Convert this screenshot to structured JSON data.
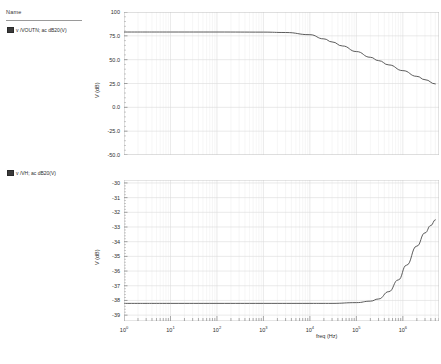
{
  "legend": {
    "header": "Name",
    "entries": [
      {
        "label": "v /VOUTN; ac dB20(V)",
        "swatch_color": "#3a3a3a",
        "icon": "color-swatch-icon"
      },
      {
        "label": "v /VH; ac dB20(V)",
        "swatch_color": "#3a3a3a",
        "icon": "color-swatch-icon"
      }
    ]
  },
  "chart_data": [
    {
      "type": "line",
      "title": "",
      "xlabel": "",
      "ylabel": "V (dB)",
      "xscale": "log",
      "xlim": [
        1,
        6000000
      ],
      "ylim": [
        -50,
        100
      ],
      "grid": true,
      "legend_position": "left-panel",
      "xticks": [
        "10^0",
        "10^1",
        "10^2",
        "10^3",
        "10^4",
        "10^5",
        "10^6"
      ],
      "yticks": [
        "100",
        "75.0",
        "50.0",
        "25.0",
        "0.0",
        "-25.0",
        "-50.0"
      ],
      "ytick_values": [
        100,
        75,
        50,
        25,
        0,
        -25,
        -50
      ],
      "series": [
        {
          "name": "v /VOUTN; ac dB20(V)",
          "color": "#4a4a4a",
          "x": [
            1,
            10,
            100,
            1000,
            3000,
            10000,
            20000,
            30000,
            50000,
            100000,
            200000,
            300000,
            500000,
            1000000,
            2000000,
            3000000,
            5000000
          ],
          "values": [
            79,
            79,
            79,
            78.9,
            78.5,
            76.2,
            71.8,
            68.6,
            64.4,
            58.5,
            52.5,
            49.0,
            44.5,
            38.5,
            32.5,
            29.0,
            24.5
          ]
        }
      ]
    },
    {
      "type": "line",
      "title": "",
      "xlabel": "freq (Hz)",
      "ylabel": "V (dB)",
      "xscale": "log",
      "xlim": [
        1,
        6000000
      ],
      "ylim": [
        -39.4,
        -29.8
      ],
      "grid": true,
      "legend_position": "left-panel",
      "xticks": [
        "10^0",
        "10^1",
        "10^2",
        "10^3",
        "10^4",
        "10^5",
        "10^6"
      ],
      "yticks": [
        "-30",
        "-31",
        "-32",
        "-33",
        "-34",
        "-35",
        "-36",
        "-37",
        "-38",
        "-39"
      ],
      "ytick_values": [
        -30,
        -31,
        -32,
        -33,
        -34,
        -35,
        -36,
        -37,
        -38,
        -39
      ],
      "series": [
        {
          "name": "v /VH; ac dB20(V)",
          "color": "#4a4a4a",
          "x": [
            1,
            10,
            100,
            1000,
            10000,
            30000,
            100000,
            200000,
            300000,
            500000,
            800000,
            1200000,
            2000000,
            3000000,
            4000000,
            5000000
          ],
          "values": [
            -38.2,
            -38.2,
            -38.2,
            -38.2,
            -38.2,
            -38.2,
            -38.15,
            -38.05,
            -37.9,
            -37.4,
            -36.6,
            -35.6,
            -34.3,
            -33.4,
            -32.9,
            -32.5
          ]
        }
      ]
    }
  ]
}
